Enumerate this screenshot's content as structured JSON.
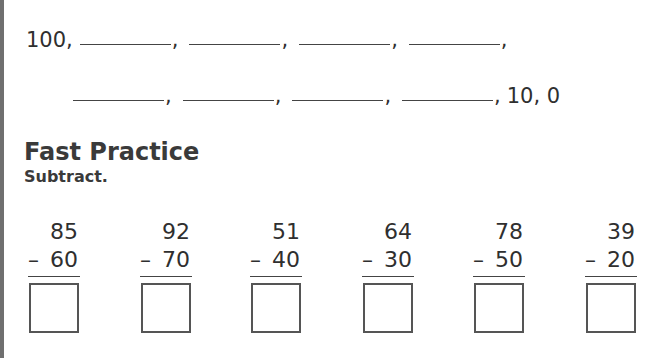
{
  "sequence": {
    "row1": {
      "start": "100,",
      "blank_count": 4
    },
    "row2": {
      "blank_count": 4,
      "end": "10, 0"
    },
    "comma": ","
  },
  "section": {
    "title": "Fast Practice",
    "instruction": "Subtract."
  },
  "problems": [
    {
      "top": "85",
      "op": "–",
      "bottom": "60"
    },
    {
      "top": "92",
      "op": "–",
      "bottom": "70"
    },
    {
      "top": "51",
      "op": "–",
      "bottom": "40"
    },
    {
      "top": "64",
      "op": "–",
      "bottom": "30"
    },
    {
      "top": "78",
      "op": "–",
      "bottom": "50"
    },
    {
      "top": "39",
      "op": "–",
      "bottom": "20"
    }
  ]
}
